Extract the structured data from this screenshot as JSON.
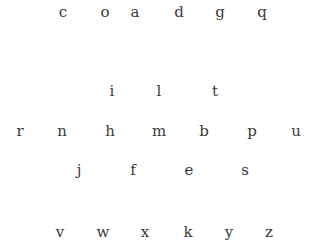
{
  "rows": [
    {
      "y": 12,
      "letters": [
        {
          "char": "c",
          "x": 63
        },
        {
          "char": "o",
          "x": 105
        },
        {
          "char": "a",
          "x": 135
        },
        {
          "char": "d",
          "x": 179
        },
        {
          "char": "g",
          "x": 220
        },
        {
          "char": "q",
          "x": 262
        }
      ]
    },
    {
      "y": 91,
      "letters": [
        {
          "char": "i",
          "x": 112
        },
        {
          "char": "l",
          "x": 159
        },
        {
          "char": "t",
          "x": 215
        }
      ]
    },
    {
      "y": 131,
      "letters": [
        {
          "char": "r",
          "x": 20
        },
        {
          "char": "n",
          "x": 62
        },
        {
          "char": "h",
          "x": 110
        },
        {
          "char": "m",
          "x": 159
        },
        {
          "char": "b",
          "x": 204
        },
        {
          "char": "p",
          "x": 252
        },
        {
          "char": "u",
          "x": 296
        }
      ]
    },
    {
      "y": 170,
      "letters": [
        {
          "char": "j",
          "x": 79
        },
        {
          "char": "f",
          "x": 133
        },
        {
          "char": "e",
          "x": 189
        },
        {
          "char": "s",
          "x": 245
        }
      ]
    },
    {
      "y": 232,
      "letters": [
        {
          "char": "v",
          "x": 60
        },
        {
          "char": "w",
          "x": 103
        },
        {
          "char": "x",
          "x": 145
        },
        {
          "char": "k",
          "x": 188
        },
        {
          "char": "y",
          "x": 229
        },
        {
          "char": "z",
          "x": 269
        }
      ]
    }
  ],
  "text_color": "#3a3a3a"
}
